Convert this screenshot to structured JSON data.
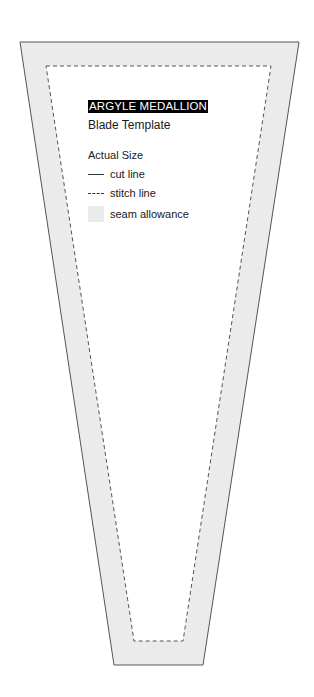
{
  "template": {
    "title": "ARGYLE MEDALLION",
    "subtitle": "Blade Template",
    "scale_note": "Actual Size"
  },
  "legend": {
    "items": [
      {
        "symbol": "solid-line",
        "label": "cut line"
      },
      {
        "symbol": "dashed-line",
        "label": "stitch line"
      },
      {
        "symbol": "gray-fill",
        "label": "seam allowance"
      }
    ]
  },
  "colors": {
    "seam_allowance_fill": "#ebebeb",
    "cut_line": "#555555",
    "stitch_line": "#555555",
    "title_bg": "#000000",
    "title_text": "#ffffff"
  }
}
